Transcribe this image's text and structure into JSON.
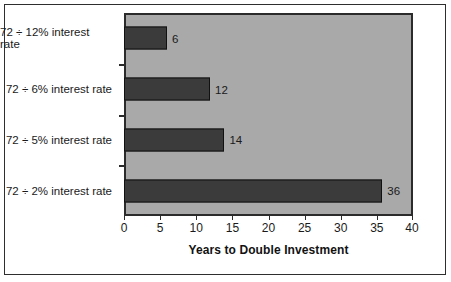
{
  "chart_data": {
    "type": "bar",
    "orientation": "horizontal",
    "title": "",
    "xlabel": "Years to Double Investment",
    "ylabel": "",
    "categories": [
      "72 ÷ 12% interest rate",
      "72 ÷ 6% interest rate",
      "72 ÷ 5% interest rate",
      "72 ÷ 2% interest rate"
    ],
    "values": [
      6,
      12,
      14,
      36
    ],
    "data_labels": [
      "6",
      "12",
      "14",
      "36"
    ],
    "xlim": [
      0,
      40
    ],
    "xticks": [
      0,
      5,
      10,
      15,
      20,
      25,
      30,
      35,
      40
    ],
    "xtick_labels": [
      "0",
      "5",
      "10",
      "15",
      "20",
      "25",
      "30",
      "35",
      "40"
    ],
    "grid": false,
    "legend": false,
    "colors": {
      "bar_fill": "#3b3b3b",
      "bar_border": "#111111",
      "plot_background": "#a9a9a9",
      "frame_border": "#2e2e2e",
      "text": "#1a1a1a",
      "page_background": "#ffffff"
    }
  }
}
